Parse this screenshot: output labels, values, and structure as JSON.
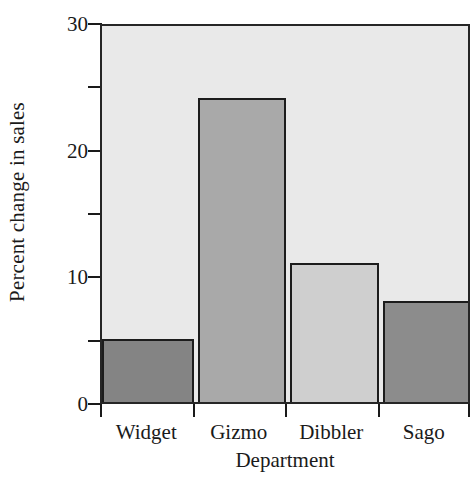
{
  "chart_data": {
    "type": "bar",
    "title": "",
    "xlabel": "Department",
    "ylabel": "Percent change in sales",
    "categories": [
      "Widget",
      "Gizmo",
      "Dibbler",
      "Sago"
    ],
    "values": [
      5,
      24,
      11,
      8
    ],
    "ylim": [
      0,
      30
    ],
    "y_major_ticks": [
      0,
      10,
      20,
      30
    ],
    "y_major_tick_labels": [
      "0",
      "10",
      "20",
      "30"
    ],
    "y_minor_ticks": [
      5,
      15,
      25
    ],
    "grid": false,
    "legend": null,
    "bar_colors": [
      "#848484",
      "#a9a9a9",
      "#cfcfcf",
      "#8c8c8c"
    ],
    "bar_edge_color": "#1c1c1c",
    "plot_background": "#e9e9e9",
    "figure_background": "#ffffff",
    "axis_color": "#262626",
    "bars": [
      {
        "category": "Widget",
        "value": 5,
        "color": "#848484"
      },
      {
        "category": "Gizmo",
        "value": 24,
        "color": "#a9a9a9"
      },
      {
        "category": "Dibbler",
        "value": 11,
        "color": "#cfcfcf"
      },
      {
        "category": "Sago",
        "value": 8,
        "color": "#8c8c8c"
      }
    ]
  }
}
